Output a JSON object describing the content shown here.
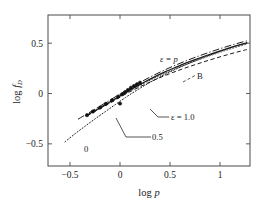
{
  "figure": {
    "background": "#ffffff",
    "frame_color": "#4a4a4a",
    "ink_color": "#1a1a1a"
  },
  "axes": {
    "x_title": "log p",
    "y_title": "log f",
    "y_title_sub": "D",
    "x_ticks": [
      "-0.5",
      "0",
      "0.5",
      "1"
    ],
    "x_tick_values": [
      -0.5,
      0,
      0.5,
      1
    ],
    "y_ticks": [
      "0.5",
      "0",
      "-0.5"
    ],
    "y_tick_values": [
      0.5,
      0,
      -0.5
    ]
  },
  "annotations": {
    "eps_p": "ε = p",
    "eps_one": "ε = 1.0",
    "half": "0.5",
    "zero": "0",
    "b_label": "B"
  },
  "chart_data": {
    "type": "line",
    "title": "",
    "xlabel": "log p",
    "ylabel": "log f_D",
    "xlim": [
      -0.72,
      1.3
    ],
    "ylim": [
      -0.72,
      0.78
    ],
    "xticks": [
      -0.5,
      0,
      0.5,
      1
    ],
    "yticks": [
      -0.5,
      0,
      0.5
    ],
    "grid": false,
    "legend": "inline-annotations",
    "series": [
      {
        "name": "ε = p",
        "style": "dash-dot",
        "x": [
          -0.42,
          -0.3,
          -0.2,
          -0.1,
          0.0,
          0.1,
          0.2,
          0.3,
          0.4,
          0.5,
          0.6,
          0.7,
          0.8,
          0.9,
          1.0,
          1.1,
          1.2,
          1.27
        ],
        "y": [
          -0.255,
          -0.185,
          -0.125,
          -0.065,
          -0.005,
          0.055,
          0.11,
          0.163,
          0.212,
          0.258,
          0.3,
          0.34,
          0.377,
          0.412,
          0.445,
          0.476,
          0.505,
          0.523
        ]
      },
      {
        "name": "ε = 1.0",
        "style": "solid",
        "x": [
          -0.33,
          -0.25,
          -0.15,
          -0.05,
          0.05,
          0.15,
          0.25,
          0.35,
          0.45,
          0.55,
          0.65,
          0.75,
          0.85,
          0.95,
          1.05,
          1.15,
          1.25,
          1.27
        ],
        "y": [
          -0.215,
          -0.17,
          -0.113,
          -0.053,
          0.008,
          0.063,
          0.117,
          0.168,
          0.215,
          0.258,
          0.299,
          0.337,
          0.373,
          0.407,
          0.44,
          0.47,
          0.498,
          0.503
        ]
      },
      {
        "name": "ε = 0.5",
        "style": "dotted-thin",
        "x": [
          -0.33,
          -0.22,
          -0.12,
          -0.02,
          0.08,
          0.18,
          0.28,
          0.38,
          0.48,
          0.58,
          0.68,
          0.78,
          0.88,
          0.98,
          1.08,
          1.18,
          1.27
        ],
        "y": [
          -0.222,
          -0.16,
          -0.103,
          -0.043,
          0.015,
          0.07,
          0.122,
          0.17,
          0.214,
          0.256,
          0.295,
          0.333,
          0.369,
          0.403,
          0.435,
          0.466,
          0.492
        ]
      },
      {
        "name": "ε = 0",
        "style": "dotted",
        "x": [
          -0.55,
          -0.45,
          -0.35,
          -0.25,
          -0.15,
          -0.05,
          0.05,
          0.15,
          0.25,
          0.35,
          0.45,
          0.55,
          0.65,
          0.75,
          0.85,
          0.95,
          1.05,
          1.15,
          1.25,
          1.27
        ],
        "y": [
          -0.48,
          -0.4,
          -0.325,
          -0.252,
          -0.182,
          -0.112,
          -0.043,
          0.022,
          0.082,
          0.138,
          0.19,
          0.238,
          0.283,
          0.325,
          0.364,
          0.401,
          0.436,
          0.468,
          0.498,
          0.503
        ]
      },
      {
        "name": "B",
        "style": "dashed",
        "x": [
          -0.33,
          -0.22,
          -0.12,
          -0.02,
          0.08,
          0.18,
          0.28,
          0.38,
          0.48,
          0.58,
          0.68,
          0.78,
          0.88,
          0.98,
          1.08,
          1.18,
          1.27
        ],
        "y": [
          -0.22,
          -0.16,
          -0.105,
          -0.048,
          0.008,
          0.058,
          0.105,
          0.15,
          0.19,
          0.228,
          0.263,
          0.296,
          0.328,
          0.358,
          0.387,
          0.414,
          0.437
        ]
      }
    ],
    "data_points": {
      "name": "measured points",
      "marker": "filled-circle",
      "x": [
        -0.33,
        -0.27,
        -0.2,
        -0.14,
        -0.08,
        -0.02,
        0.02,
        0.05,
        0.08,
        0.11,
        0.14,
        0.17,
        0.2,
        0.0
      ],
      "y": [
        -0.215,
        -0.178,
        -0.14,
        -0.102,
        -0.068,
        -0.032,
        -0.008,
        0.012,
        0.035,
        0.058,
        0.075,
        0.092,
        0.108,
        -0.1
      ]
    }
  }
}
